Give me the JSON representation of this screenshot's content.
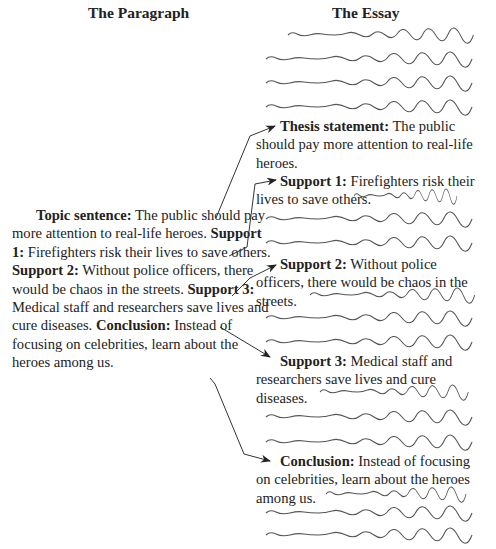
{
  "headers": {
    "paragraph": "The Paragraph",
    "essay": "The Essay"
  },
  "paragraph": {
    "topic_label": "Topic sentence:",
    "topic_text": " The public should pay more attention to real-life heroes. ",
    "support1_label": "Support 1:",
    "support1_text": " Firefighters risk their lives to save others. ",
    "support2_label": "Support 2:",
    "support2_text": " Without police officers, there would be chaos in the streets. ",
    "support3_label": "Support 3:",
    "support3_text": " Medical staff and researchers save lives and cure diseases. ",
    "conclusion_label": "Conclusion:",
    "conclusion_text": " Instead of focusing on celebrities, learn about the heroes among us."
  },
  "essay": {
    "thesis_label": "Thesis statement:",
    "thesis_text": " The public should pay more attention to real-life heroes.",
    "support1_label": "Support 1:",
    "support1_text": " Firefighters risk their lives to save others.",
    "support2_label": "Support 2:",
    "support2_text": " Without police officers, there would be chaos in the streets.",
    "support3_label": "Support 3:",
    "support3_text": " Medical staff and researchers save lives and cure diseases.",
    "conclusion_label": "Conclusion:",
    "conclusion_text": " Instead of focusing on celebrities, learn about the heroes among us."
  },
  "colors": {
    "text": "#222222",
    "lines": "#555555",
    "background": "#ffffff"
  }
}
